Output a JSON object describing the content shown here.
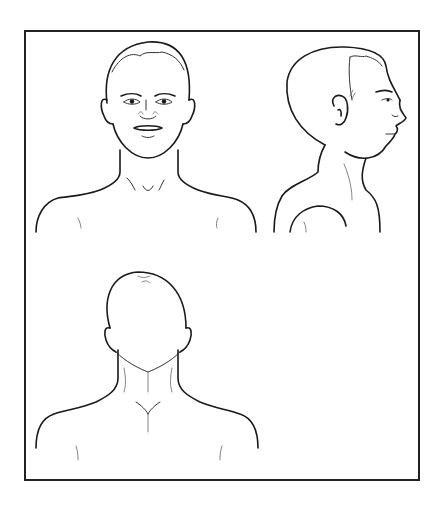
{
  "illustration": {
    "description": "Line-art anatomical head and shoulder templates",
    "views": [
      {
        "id": "front",
        "label": "Front view of head and shoulders"
      },
      {
        "id": "side",
        "label": "Right profile view of head and shoulders"
      },
      {
        "id": "back",
        "label": "Back view of head and shoulders"
      }
    ],
    "colors": {
      "line": "#1a1a1a",
      "frame": "#222222",
      "background": "#ffffff"
    }
  }
}
